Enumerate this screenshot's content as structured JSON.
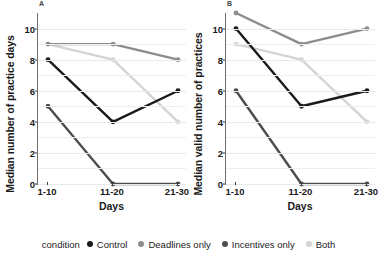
{
  "chart_data": {
    "type": "line",
    "title": "",
    "xlabel": "Days",
    "categories": [
      "1-10",
      "11-20",
      "21-30"
    ],
    "grid": true,
    "legend_position": "bottom",
    "legend_title": "condition",
    "panels": [
      {
        "tag": "A",
        "ylabel": "Median number of practice days",
        "ylim": [
          0,
          11
        ],
        "yticks": [
          0,
          2,
          4,
          6,
          8,
          10
        ],
        "series": [
          {
            "name": "Control",
            "color": "#1a1a1a",
            "values": [
              8,
              4,
              6
            ]
          },
          {
            "name": "Deadlines only",
            "color": "#8c8c8c",
            "values": [
              9,
              9,
              8
            ]
          },
          {
            "name": "Incentives only",
            "color": "#4d4d4d",
            "values": [
              5,
              0,
              0
            ]
          },
          {
            "name": "Both",
            "color": "#d4d4d4",
            "values": [
              9,
              8,
              4
            ]
          }
        ]
      },
      {
        "tag": "B",
        "ylabel": "Median valid number of practices",
        "ylim": [
          0,
          11
        ],
        "yticks": [
          0,
          2,
          4,
          6,
          8,
          10
        ],
        "series": [
          {
            "name": "Control",
            "color": "#1a1a1a",
            "values": [
              10,
              5,
              6
            ]
          },
          {
            "name": "Deadlines only",
            "color": "#8c8c8c",
            "values": [
              11,
              9,
              10
            ]
          },
          {
            "name": "Incentives only",
            "color": "#4d4d4d",
            "values": [
              6,
              0,
              0
            ]
          },
          {
            "name": "Both",
            "color": "#d4d4d4",
            "values": [
              9,
              8,
              4
            ]
          }
        ]
      }
    ]
  },
  "legend": {
    "title": "condition",
    "items": [
      {
        "label": "Control",
        "color": "#1a1a1a"
      },
      {
        "label": "Deadlines only",
        "color": "#8c8c8c"
      },
      {
        "label": "Incentives only",
        "color": "#4d4d4d"
      },
      {
        "label": "Both",
        "color": "#d4d4d4"
      }
    ]
  }
}
